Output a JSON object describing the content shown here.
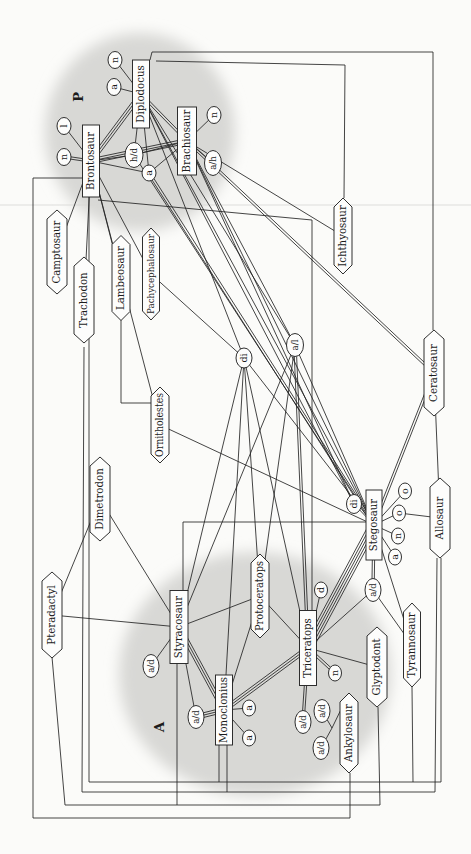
{
  "figure": {
    "bg": "#fbfbf9",
    "ink": "#242424",
    "node_fill": "#fdfdfc",
    "cloud_color": "#d8d8d5",
    "artifact_line_y": 205,
    "artifact_color": "rgba(60,60,60,0.10)"
  },
  "groups": [
    {
      "id": "P",
      "label": "P",
      "cx": 722,
      "cy": 140,
      "rx": 99,
      "ry": 95,
      "lx": 757,
      "ly": 83
    },
    {
      "id": "A",
      "label": "A",
      "cx": 180,
      "cy": 255,
      "rx": 122,
      "ry": 136,
      "lx": 127,
      "ly": 164
    }
  ],
  "nodes": [
    {
      "id": "bronto",
      "label": "Brontosaur",
      "shape": "rect",
      "x": 693,
      "y": 91,
      "w": 72,
      "h": 17
    },
    {
      "id": "diplo",
      "label": "Diplodocus",
      "shape": "rect",
      "x": 760,
      "y": 141,
      "w": 68,
      "h": 17
    },
    {
      "id": "brachio",
      "label": "Brachiosaur",
      "shape": "rect",
      "x": 713,
      "y": 187,
      "w": 68,
      "h": 19
    },
    {
      "id": "stego",
      "label": "Stegosaur",
      "shape": "rect",
      "x": 329,
      "y": 374,
      "w": 70,
      "h": 16
    },
    {
      "id": "styraco",
      "label": "Styracosaur",
      "shape": "rect",
      "x": 227,
      "y": 179,
      "w": 73,
      "h": 18
    },
    {
      "id": "tricer",
      "label": "Triceratops",
      "shape": "rect",
      "x": 206,
      "y": 308,
      "w": 75,
      "h": 17
    },
    {
      "id": "mono",
      "label": "Monoclonius",
      "shape": "rect",
      "x": 144,
      "y": 224,
      "w": 70,
      "h": 17
    },
    {
      "id": "campto",
      "label": "Camptosaur",
      "shape": "hex",
      "x": 602,
      "y": 57,
      "w": 84,
      "h": 20
    },
    {
      "id": "tracho",
      "label": "Trachodon",
      "shape": "hex",
      "x": 554,
      "y": 84,
      "w": 86,
      "h": 20
    },
    {
      "id": "lambeo",
      "label": "Lambeosaur",
      "shape": "hex",
      "x": 576,
      "y": 121,
      "w": 85,
      "h": 18
    },
    {
      "id": "pachy",
      "label": "Pachycephalosaur",
      "shape": "hex",
      "x": 580,
      "y": 151,
      "w": 92,
      "h": 17,
      "fs": 8.6,
      "tl": 80
    },
    {
      "id": "ichthyo",
      "label": "Ichthyosaur",
      "shape": "hex",
      "x": 618,
      "y": 343,
      "w": 76,
      "h": 18
    },
    {
      "id": "ornith",
      "label": "Ornitholestes",
      "shape": "hex",
      "x": 429,
      "y": 160,
      "w": 76,
      "h": 18,
      "tl": 64
    },
    {
      "id": "dimetro",
      "label": "Dimetrodon",
      "shape": "hex",
      "x": 355,
      "y": 100,
      "w": 84,
      "h": 20
    },
    {
      "id": "cerato",
      "label": "Ceratosaur",
      "shape": "hex",
      "x": 481,
      "y": 434,
      "w": 86,
      "h": 20
    },
    {
      "id": "allo",
      "label": "Allosaur",
      "shape": "hex",
      "x": 336,
      "y": 440,
      "w": 80,
      "h": 20
    },
    {
      "id": "ptera",
      "label": "Pteradactyl",
      "shape": "hex",
      "x": 239,
      "y": 52,
      "w": 86,
      "h": 20
    },
    {
      "id": "proto",
      "label": "Protoceratops",
      "shape": "hex",
      "x": 258,
      "y": 260,
      "w": 84,
      "h": 18,
      "tl": 70
    },
    {
      "id": "glypto",
      "label": "Glyptodont",
      "shape": "hex",
      "x": 187,
      "y": 377,
      "w": 80,
      "h": 20
    },
    {
      "id": "tyranno",
      "label": "Tyrannosaur",
      "shape": "hex",
      "x": 209,
      "y": 412,
      "w": 84,
      "h": 17
    },
    {
      "id": "ankylo",
      "label": "Ankylosaur",
      "shape": "hex",
      "x": 121,
      "y": 349,
      "w": 80,
      "h": 18
    },
    {
      "id": "n1",
      "label": "n",
      "shape": "ell",
      "x": 794,
      "y": 115,
      "w": 17,
      "h": 14
    },
    {
      "id": "a1",
      "label": "a",
      "shape": "ell",
      "x": 767,
      "y": 114,
      "w": 17,
      "h": 14
    },
    {
      "id": "l1",
      "label": "l",
      "shape": "ell",
      "x": 728,
      "y": 64,
      "w": 17,
      "h": 14
    },
    {
      "id": "n2",
      "label": "n",
      "shape": "ell",
      "x": 697,
      "y": 64,
      "w": 17,
      "h": 14
    },
    {
      "id": "hd",
      "label": "h/d",
      "shape": "ell",
      "x": 699,
      "y": 134,
      "w": 25,
      "h": 18,
      "fs": 8.6
    },
    {
      "id": "a2",
      "label": "a",
      "shape": "ell",
      "x": 681,
      "y": 149,
      "w": 16,
      "h": 14
    },
    {
      "id": "n3",
      "label": "n",
      "shape": "ell",
      "x": 739,
      "y": 214,
      "w": 17,
      "h": 14
    },
    {
      "id": "ah",
      "label": "a/h",
      "shape": "ell",
      "x": 691,
      "y": 213,
      "w": 25,
      "h": 17,
      "fs": 8.6
    },
    {
      "id": "di1",
      "label": "di",
      "shape": "ell",
      "x": 496,
      "y": 244,
      "w": 20,
      "h": 16
    },
    {
      "id": "al",
      "label": "a/l",
      "shape": "ell",
      "x": 509,
      "y": 295,
      "w": 23,
      "h": 17,
      "fs": 8.6
    },
    {
      "id": "di2",
      "label": "di",
      "shape": "ell",
      "x": 350,
      "y": 354,
      "w": 19,
      "h": 15
    },
    {
      "id": "o1",
      "label": "o",
      "shape": "ell",
      "x": 363,
      "y": 405,
      "w": 16,
      "h": 13
    },
    {
      "id": "o2",
      "label": "o",
      "shape": "ell",
      "x": 341,
      "y": 399,
      "w": 16,
      "h": 13
    },
    {
      "id": "n4",
      "label": "n",
      "shape": "ell",
      "x": 318,
      "y": 398,
      "w": 16,
      "h": 13
    },
    {
      "id": "a3",
      "label": "a",
      "shape": "ell",
      "x": 297,
      "y": 395,
      "w": 16,
      "h": 13
    },
    {
      "id": "ad6",
      "label": "a/d",
      "shape": "ell",
      "x": 264,
      "y": 373,
      "w": 23,
      "h": 16,
      "fs": 8.6
    },
    {
      "id": "d1",
      "label": "d",
      "shape": "ell",
      "x": 264,
      "y": 321,
      "w": 16,
      "h": 13
    },
    {
      "id": "n5",
      "label": "n",
      "shape": "ell",
      "x": 181,
      "y": 335,
      "w": 16,
      "h": 13
    },
    {
      "id": "ad1",
      "label": "a/d",
      "shape": "ell",
      "x": 188,
      "y": 151,
      "w": 23,
      "h": 16,
      "fs": 8.6
    },
    {
      "id": "ad2",
      "label": "a/d",
      "shape": "ell",
      "x": 137,
      "y": 196,
      "w": 23,
      "h": 16,
      "fs": 8.6
    },
    {
      "id": "a4",
      "label": "a",
      "shape": "ell",
      "x": 146,
      "y": 249,
      "w": 16,
      "h": 13
    },
    {
      "id": "a5",
      "label": "a",
      "shape": "ell",
      "x": 116,
      "y": 249,
      "w": 16,
      "h": 13
    },
    {
      "id": "ad3",
      "label": "a/d",
      "shape": "ell",
      "x": 132,
      "y": 303,
      "w": 23,
      "h": 16,
      "fs": 8.6
    },
    {
      "id": "ad4",
      "label": "a/d",
      "shape": "ell",
      "x": 143,
      "y": 322,
      "w": 23,
      "h": 16,
      "fs": 8.6
    },
    {
      "id": "ad5",
      "label": "a/d",
      "shape": "ell",
      "x": 106,
      "y": 321,
      "w": 23,
      "h": 16,
      "fs": 8.6
    }
  ],
  "edges": [
    [
      "diplo",
      "n1",
      1
    ],
    [
      "diplo",
      "a1",
      1
    ],
    [
      "bronto",
      "l1",
      1
    ],
    [
      "bronto",
      "n2",
      2
    ],
    [
      "bronto",
      "hd",
      1
    ],
    [
      "diplo",
      "hd",
      1
    ],
    [
      "hd",
      "brachio",
      1
    ],
    [
      "diplo",
      "a2",
      1
    ],
    [
      "brachio",
      "n3",
      1
    ],
    [
      "brachio",
      "ah",
      1
    ],
    [
      "diplo",
      "bronto",
      3
    ],
    [
      "bronto",
      "brachio",
      3
    ],
    [
      "diplo",
      "brachio",
      2
    ],
    [
      "bronto",
      "a2",
      1
    ],
    [
      "a2",
      "brachio",
      1
    ],
    [
      "bronto",
      "campto",
      1
    ],
    [
      "bronto",
      "tracho",
      1
    ],
    [
      "bronto",
      "lambeo",
      1
    ],
    [
      "bronto",
      "pachy",
      1
    ],
    [
      "bronto",
      "ornith",
      1
    ],
    [
      "brachio",
      "ichthyo",
      1
    ],
    [
      "brachio",
      "cerato",
      2
    ],
    [
      "brachio",
      "al",
      1
    ],
    [
      "brachio",
      "stego",
      1
    ],
    [
      "brachio",
      "di2",
      1
    ],
    [
      "diplo",
      "di1",
      1
    ],
    [
      "diplo",
      "al",
      1
    ],
    [
      "diplo",
      "stego",
      1
    ],
    [
      "diplo",
      "di2",
      1
    ],
    [
      "hd",
      "stego",
      1
    ],
    [
      "a2",
      "stego",
      2
    ],
    [
      "pachy",
      "di1",
      1
    ],
    [
      "ornith",
      "stego",
      1
    ],
    [
      "dimetro",
      "styraco",
      1
    ],
    [
      "ptera",
      "styraco",
      1
    ],
    [
      "ptera",
      "dimetro",
      1
    ],
    [
      "di1",
      "stego",
      1
    ],
    [
      "di1",
      "styraco",
      1
    ],
    [
      "di1",
      "mono",
      1
    ],
    [
      "di1",
      "tricer",
      1
    ],
    [
      "di1",
      "proto",
      1
    ],
    [
      "al",
      "stego",
      1
    ],
    [
      "al",
      "tricer",
      2
    ],
    [
      "al",
      "styraco",
      1
    ],
    [
      "al",
      "proto",
      1
    ],
    [
      "cerato",
      "stego",
      2
    ],
    [
      "cerato",
      "allo",
      1
    ],
    [
      "stego",
      "tricer",
      5
    ],
    [
      "stego",
      "tyranno",
      1
    ],
    [
      "o2",
      "allo",
      1
    ],
    [
      "styraco",
      "mono",
      3
    ],
    [
      "mono",
      "tricer",
      3
    ],
    [
      "styraco",
      "proto",
      1
    ],
    [
      "proto",
      "mono",
      1
    ],
    [
      "proto",
      "tricer",
      1
    ],
    [
      "tricer",
      "glypto",
      1
    ],
    [
      "stego",
      "di2",
      1
    ],
    [
      "stego",
      "o1",
      1
    ],
    [
      "stego",
      "o2",
      1
    ],
    [
      "stego",
      "n4",
      1
    ],
    [
      "stego",
      "a3",
      1
    ],
    [
      "stego",
      "ad6",
      2
    ],
    [
      "ad6",
      "tyranno",
      1
    ],
    [
      "ad6",
      "tricer",
      1
    ],
    [
      "tricer",
      "d1",
      1
    ],
    [
      "tricer",
      "n5",
      2
    ],
    [
      "tricer",
      "ad3",
      2
    ],
    [
      "styraco",
      "ad1",
      1
    ],
    [
      "mono",
      "ad2",
      3
    ],
    [
      "styraco",
      "ad2",
      1
    ],
    [
      "mono",
      "a4",
      1
    ],
    [
      "mono",
      "a5",
      1
    ]
  ],
  "routes": [
    {
      "name": "bronto-ankylo-outer-frame",
      "pts": [
        [
          676,
          83
        ],
        [
          676,
          33
        ],
        [
          36,
          33
        ],
        [
          36,
          350
        ],
        [
          81,
          350
        ]
      ]
    },
    {
      "name": "tracho-allo-frame",
      "pts": [
        [
          507,
          84
        ],
        [
          62,
          82
        ],
        [
          62,
          435
        ],
        [
          296,
          437
        ]
      ]
    },
    {
      "name": "bronto-tyranno-frame",
      "pts": [
        [
          657,
          89
        ],
        [
          72,
          89
        ],
        [
          72,
          413
        ],
        [
          167,
          412
        ]
      ]
    },
    {
      "name": "ptera-glypto-frame",
      "pts": [
        [
          197,
          52
        ],
        [
          49,
          65
        ],
        [
          49,
          380
        ],
        [
          147,
          378
        ]
      ]
    },
    {
      "name": "styraco-frame-drop",
      "pts": [
        [
          191,
          177
        ],
        [
          49,
          177
        ]
      ]
    },
    {
      "name": "mono-frame-drop-1",
      "pts": [
        [
          109,
          219
        ],
        [
          72,
          219
        ]
      ]
    },
    {
      "name": "mono-frame-drop-2",
      "pts": [
        [
          109,
          227
        ],
        [
          62,
          227
        ]
      ]
    },
    {
      "name": "diplo-cerato-frame",
      "pts": [
        [
          794,
          150
        ],
        [
          802,
          152
        ],
        [
          802,
          433
        ],
        [
          524,
          433
        ]
      ]
    },
    {
      "name": "diplo-ichthyo-frame",
      "pts": [
        [
          793,
          156
        ],
        [
          789,
          345
        ],
        [
          656,
          344
        ]
      ]
    },
    {
      "name": "bronto-tricer-bend",
      "pts": [
        [
          654,
          98
        ],
        [
          634,
          312
        ],
        [
          244,
          312
        ]
      ]
    },
    {
      "name": "allo-frame-drop",
      "pts": [
        [
          296,
          441
        ],
        [
          72,
          441
        ],
        [
          72,
          413
        ]
      ]
    },
    {
      "name": "styraco-stego-bend",
      "pts": [
        [
          264,
          183
        ],
        [
          332,
          183
        ],
        [
          332,
          367
        ]
      ]
    },
    {
      "name": "lambeo-ornith-bend",
      "pts": [
        [
          534,
          121
        ],
        [
          451,
          121
        ],
        [
          451,
          152
        ]
      ]
    },
    {
      "name": "ad4-ankylo-fork",
      "pts": [
        [
          143,
          322
        ],
        [
          126,
          332
        ],
        [
          161,
          349
        ]
      ]
    },
    {
      "name": "ad5-fork",
      "pts": [
        [
          106,
          321
        ],
        [
          126,
          332
        ]
      ]
    }
  ]
}
